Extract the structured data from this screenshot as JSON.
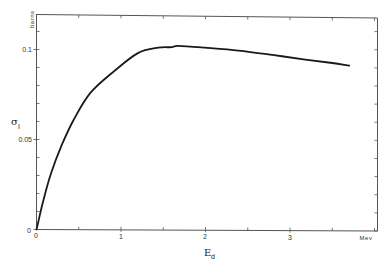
{
  "chart_data": {
    "type": "line",
    "title": "",
    "xlabel": "E",
    "xlabel_subscript": "d",
    "x_unit": "Mev",
    "ylabel": "σ",
    "ylabel_subscript": "I",
    "y_unit": "barns",
    "xlim": [
      0,
      4.0
    ],
    "ylim": [
      0,
      0.12
    ],
    "x_ticks": [
      0,
      1,
      2,
      3
    ],
    "x_tick_labels": [
      "0",
      "1",
      "2",
      "3"
    ],
    "x_minor_tick_step": 0.5,
    "y_ticks": [
      0,
      0.05,
      0.1
    ],
    "y_tick_labels": [
      "0",
      "0.05",
      "0.1"
    ],
    "y_minor_tick_step": 0.01,
    "grid": false,
    "legend": null,
    "series": [
      {
        "name": "σ_I vs E_d",
        "color": "#1a1a1a",
        "x": [
          0.0,
          0.02,
          0.08,
          0.17,
          0.3,
          0.44,
          0.64,
          0.92,
          1.2,
          1.44,
          1.6,
          1.68,
          1.99,
          2.39,
          2.79,
          3.18,
          3.5,
          3.7
        ],
        "y": [
          0.0,
          0.004,
          0.016,
          0.031,
          0.047,
          0.061,
          0.076,
          0.088,
          0.098,
          0.101,
          0.1013,
          0.102,
          0.101,
          0.0994,
          0.097,
          0.0944,
          0.0925,
          0.091
        ]
      }
    ]
  },
  "labels": {
    "y_unit": "barns",
    "y_title": "σ",
    "y_title_sub": "I",
    "x_title": "E",
    "x_title_sub": "d",
    "x_unit": "Mev",
    "y_tick_0": "0",
    "y_tick_005": "0.05",
    "y_tick_01": "0.1",
    "x_tick_0": "0",
    "x_tick_1": "1",
    "x_tick_2": "2",
    "x_tick_3": "3"
  }
}
